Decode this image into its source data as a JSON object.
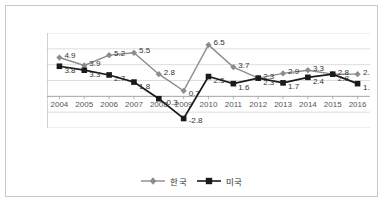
{
  "chart_data": {
    "type": "line",
    "title": "",
    "xlabel": "",
    "ylabel": "",
    "categories": [
      "2004",
      "2005",
      "2006",
      "2007",
      "2008",
      "2009",
      "2010",
      "2011",
      "2012",
      "2013",
      "2014",
      "2015",
      "2016"
    ],
    "ylim": [
      -4,
      8
    ],
    "ytick_labels": [
      "8%",
      "6%",
      "4%",
      "2%",
      "0%",
      "-2%",
      "-4%"
    ],
    "yticks": [
      8,
      6,
      4,
      2,
      0,
      -2,
      -4
    ],
    "grid": true,
    "legend_position": "bottom",
    "series": [
      {
        "name": "한국",
        "color": "#8c8c8c",
        "marker": "diamond",
        "values": [
          4.9,
          3.9,
          5.2,
          5.5,
          2.8,
          0.7,
          6.5,
          3.7,
          2.3,
          2.9,
          3.3,
          2.8,
          2.8
        ],
        "labels": [
          "4.9",
          "3.9",
          "5.2",
          "5.5",
          "2.8",
          "0.7",
          "6.5",
          "3.7",
          "2.3",
          "2.9",
          "3.3",
          "2.8",
          "2.8"
        ]
      },
      {
        "name": "미국",
        "color": "#1a1a1a",
        "marker": "square",
        "values": [
          3.8,
          3.3,
          2.7,
          1.8,
          -0.3,
          -2.8,
          2.5,
          1.6,
          2.3,
          1.7,
          2.4,
          2.8,
          1.6
        ],
        "labels": [
          "3.8",
          "3.3",
          "2.7",
          "1.8",
          "-0.3",
          "-2.8",
          "2.5",
          "1.6",
          "2.3",
          "1.7",
          "2.4",
          "2.8",
          "1.6"
        ]
      }
    ]
  },
  "legend": {
    "items": [
      {
        "label": "한국"
      },
      {
        "label": "미국"
      }
    ]
  }
}
